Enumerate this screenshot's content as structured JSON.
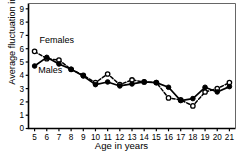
{
  "chart_data": {
    "type": "line",
    "title": "",
    "xlabel": "Age in years",
    "ylabel": "Average fluctuation indices",
    "x": [
      5,
      6,
      7,
      8,
      9,
      10,
      11,
      12,
      13,
      14,
      15,
      16,
      17,
      18,
      19,
      20,
      21
    ],
    "xlim": [
      4.5,
      21.5
    ],
    "ylim": [
      0,
      9.4
    ],
    "xticks": [
      "5",
      "6",
      "7",
      "8",
      "9",
      "10",
      "11",
      "12",
      "13",
      "14",
      "15",
      "16",
      "17",
      "18",
      "19",
      "20",
      "21"
    ],
    "yticks": [
      "0",
      "1",
      "2",
      "3",
      "4",
      "5",
      "6",
      "7",
      "8",
      "9"
    ],
    "grid": false,
    "legend_position": "inside-upper-left",
    "series": [
      {
        "name": "Females",
        "marker": "open-circle",
        "linestyle": "dashed",
        "color": "#000000",
        "values": [
          5.8,
          5.25,
          5.15,
          4.45,
          4.0,
          3.45,
          4.1,
          3.3,
          3.65,
          3.5,
          3.45,
          2.3,
          2.15,
          1.7,
          2.75,
          3.0,
          3.45
        ]
      },
      {
        "name": "Males",
        "marker": "filled-circle",
        "linestyle": "solid",
        "color": "#000000",
        "values": [
          4.7,
          5.35,
          4.85,
          4.45,
          3.95,
          3.3,
          3.5,
          3.2,
          3.35,
          3.5,
          3.45,
          3.1,
          2.1,
          2.25,
          3.1,
          2.75,
          3.15
        ]
      }
    ],
    "annotations": [
      {
        "text": "Females",
        "x": 5.4,
        "y": 6.4
      },
      {
        "text": "Males",
        "x": 5.3,
        "y": 4.2
      }
    ]
  }
}
